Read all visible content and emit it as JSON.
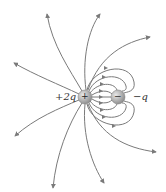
{
  "diagram": {
    "charges": [
      {
        "id": "positive",
        "label": "+2q",
        "sign_glyph": "+",
        "cx": 85,
        "cy": 97,
        "r": 7
      },
      {
        "id": "negative",
        "label": "−q",
        "sign_glyph": "−",
        "cx": 118,
        "cy": 97,
        "r": 7
      }
    ],
    "colors": {
      "line": "#7a7a7a",
      "sphere_light": "#d8d8d8",
      "sphere_dark": "#8a8a8a",
      "text": "#333333"
    },
    "outer_lines_count": 8,
    "inner_lines_count": 8
  }
}
